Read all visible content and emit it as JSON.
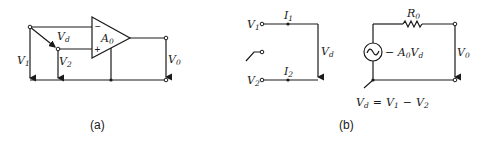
{
  "figure": {
    "panel_a": {
      "caption": "(a)",
      "opamp": {
        "gain_label": "A",
        "gain_sub": "0",
        "minus_sign": "−",
        "plus_sign": "+"
      },
      "labels": {
        "v1": "V",
        "v1_sub": "1",
        "v2": "V",
        "v2_sub": "2",
        "vd": "V",
        "vd_sub": "d",
        "vo": "V",
        "vo_sub": "0"
      }
    },
    "panel_b": {
      "caption": "(b)",
      "labels": {
        "v1": "V",
        "v1_sub": "1",
        "v2": "V",
        "v2_sub": "2",
        "i1": "I",
        "i1_sub": "1",
        "i2": "I",
        "i2_sub": "2",
        "vd": "V",
        "vd_sub": "d",
        "r0": "R",
        "r0_sub": "0",
        "vo": "V",
        "vo_sub": "0",
        "source_pre": "− A",
        "source_a_sub": "0",
        "source_v": "V",
        "source_v_sub": "d"
      },
      "equation": {
        "lhs": "V",
        "lhs_sub": "d",
        "eq": "=",
        "t1": "V",
        "t1_sub": "1",
        "minus": "−",
        "t2": "V",
        "t2_sub": "2"
      }
    }
  }
}
